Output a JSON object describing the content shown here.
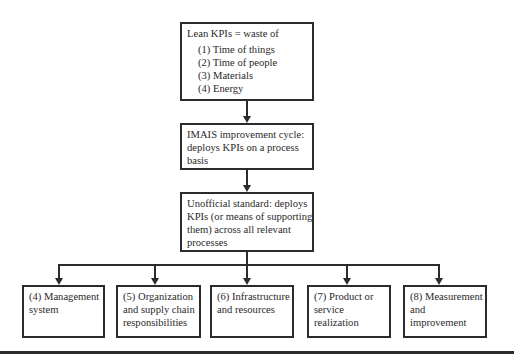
{
  "diagram": {
    "top_box": {
      "title": "Lean KPIs = waste of",
      "items": [
        "(1) Time of things",
        "(2) Time of people",
        "(3) Materials",
        "(4) Energy"
      ]
    },
    "middle_box": {
      "lines": [
        "IMAIS improvement cycle:",
        "deploys KPIs on a process",
        "basis"
      ]
    },
    "standard_box": {
      "lines": [
        "Unofficial standard: deploys",
        "KPIs (or means of supporting",
        "them) across all relevant",
        "processes"
      ]
    },
    "bottom_boxes": [
      {
        "lines": [
          "(4) Management",
          "system"
        ]
      },
      {
        "lines": [
          "(5) Organization",
          "and supply chain",
          "responsibilities"
        ]
      },
      {
        "lines": [
          "(6) Infrastructure",
          "and resources"
        ]
      },
      {
        "lines": [
          "(7) Product or",
          "service",
          "realization"
        ]
      },
      {
        "lines": [
          "(8) Measurement",
          "and",
          "improvement"
        ]
      }
    ],
    "colors": {
      "stroke": "#2b2b2b",
      "background": "#ffffff",
      "text": "#2a2a2a"
    }
  }
}
